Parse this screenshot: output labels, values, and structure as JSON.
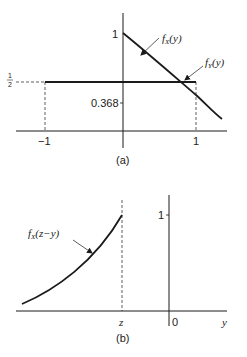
{
  "panel_a": {
    "caption": "(a)",
    "y_tick_one": "1",
    "y_tick_half_num": "1",
    "y_tick_half_den": "2",
    "value_label": "0.368",
    "x_tick_neg1": "−1",
    "x_tick_pos1": "1",
    "curve_fx": {
      "f": "f",
      "sub": "X",
      "arg": "(y)"
    },
    "curve_fy": {
      "f": "f",
      "sub": "Y",
      "arg": "(y)"
    }
  },
  "panel_b": {
    "caption": "(b)",
    "y_tick_one": "1",
    "x_label_z": "z",
    "x_label_zero": "0",
    "axis_label_y": "y",
    "curve_fx": {
      "f": "f",
      "sub": "X",
      "arg": "(z−y)"
    }
  },
  "colors": {
    "line": "#1a1a1a",
    "text": "#222222",
    "background": "#ffffff"
  }
}
